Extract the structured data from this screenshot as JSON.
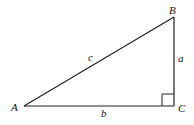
{
  "diagram": {
    "type": "right-triangle",
    "vertices": [
      {
        "id": "A",
        "label": "A",
        "x": 24,
        "y": 106
      },
      {
        "id": "B",
        "label": "B",
        "x": 174,
        "y": 17
      },
      {
        "id": "C",
        "label": "C",
        "x": 174,
        "y": 106
      }
    ],
    "sides": [
      {
        "id": "a",
        "label": "a",
        "from": "B",
        "to": "C"
      },
      {
        "id": "b",
        "label": "b",
        "from": "A",
        "to": "C"
      },
      {
        "id": "c",
        "label": "c",
        "from": "A",
        "to": "B"
      }
    ],
    "right_angle_at": "C",
    "stroke_color": "#222222"
  },
  "labels": {
    "A": "A",
    "B": "B",
    "C": "C",
    "a": "a",
    "b": "b",
    "c": "c"
  }
}
